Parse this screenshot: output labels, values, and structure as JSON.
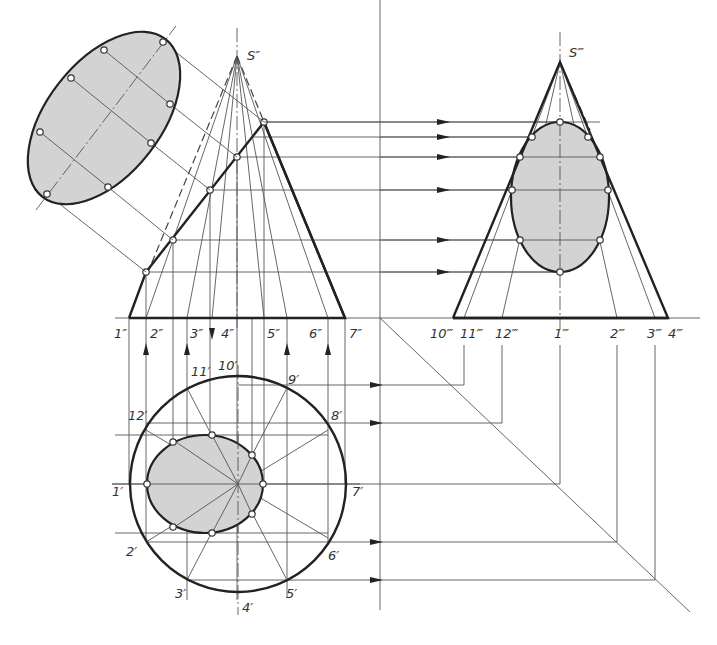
{
  "diagram": {
    "type": "descriptive-geometry",
    "views": {
      "front": {
        "apex_label": "S″",
        "base_labels": [
          "1″",
          "2″",
          "3″",
          "4″",
          "5″",
          "6″",
          "7″"
        ]
      },
      "side": {
        "apex_label": "S‴",
        "base_labels": [
          "10‴",
          "11‴",
          "12‴",
          "1‴",
          "2‴",
          "3‴",
          "4‴"
        ]
      },
      "top": {
        "circle_labels": [
          "1′",
          "2′",
          "3′",
          "4′",
          "5′",
          "6′",
          "7′",
          "8′",
          "9′",
          "10′",
          "11′",
          "12′"
        ]
      },
      "true_shape": {
        "description": "Rotated ellipse showing true size of section"
      }
    },
    "colors": {
      "line": "#222222",
      "thin_line": "#555555",
      "section_fill": "#d3d3d3",
      "background": "#ffffff"
    }
  }
}
